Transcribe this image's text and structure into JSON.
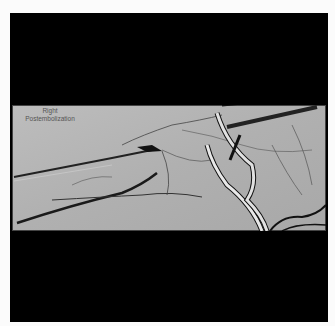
{
  "image": {
    "type": "angiogram",
    "annotation": {
      "line1": "Right",
      "line2": "Postembolization"
    },
    "colors": {
      "frame": "#000000",
      "background": "#fbfbfb",
      "film": "#b4b4b4",
      "vessel": "#1a1a1a"
    }
  }
}
